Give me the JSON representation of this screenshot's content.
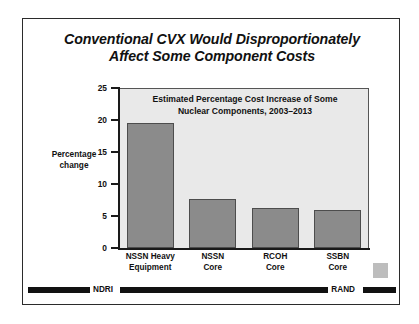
{
  "slide": {
    "title_line1": "Conventional CVX Would Disproportionately",
    "title_line2": "Affect Some Component Costs"
  },
  "footer": {
    "left_label": "NDRI",
    "right_label": "RAND"
  },
  "chart_data": {
    "type": "bar",
    "title": "Estimated Percentage Cost Increase of Some Nuclear Components, 2003–2013",
    "title_line1": "Estimated Percentage Cost Increase of Some",
    "title_line2": "Nuclear Components, 2003–2013",
    "xlabel": "",
    "ylabel": "Percentage change",
    "ylabel_line1": "Percentage",
    "ylabel_line2": "change",
    "ylim": [
      0,
      25
    ],
    "yticks": [
      0,
      5,
      10,
      15,
      20,
      25
    ],
    "ytick_labels": [
      "0",
      "5",
      "10",
      "15",
      "20",
      "25"
    ],
    "grid": false,
    "legend": "none",
    "categories": [
      "NSSN Heavy Equipment",
      "NSSN Core",
      "RCOH Core",
      "SSBN Core"
    ],
    "category_lines": [
      {
        "line1": "NSSN Heavy",
        "line2": "Equipment"
      },
      {
        "line1": "NSSN",
        "line2": "Core"
      },
      {
        "line1": "RCOH",
        "line2": "Core"
      },
      {
        "line1": "SSBN",
        "line2": "Core"
      }
    ],
    "values": [
      19.5,
      7.6,
      6.3,
      5.9
    ],
    "bar_color": "#8b8b8b",
    "plot_background": "#e9e9e9",
    "axis_color": "#1a1a1a"
  }
}
